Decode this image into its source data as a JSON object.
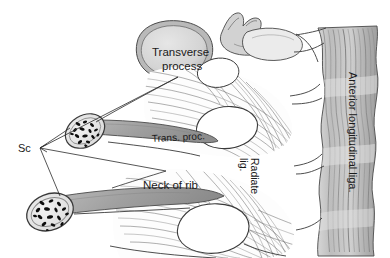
{
  "figure": {
    "background_color": "#ffffff",
    "line_color": "#3a3a3a",
    "labels": {
      "transverse_process": "Transverse\nprocess",
      "transverse_process_line1": "Transverse",
      "transverse_process_line2": "process",
      "trans_proc_short": "Trans. proc.",
      "neck_of_rib": "Neck of rib",
      "sc": "Sc",
      "radiate_lig_line1": "Radiate",
      "radiate_lig_line2": "lig.",
      "anterior_longitudinal": "Anterior longitudinal liga."
    },
    "structures": [
      {
        "name": "transverse-process-upper",
        "label": "Transverse process",
        "fill": "#d8d8d8",
        "rim": "#9a9a9a"
      },
      {
        "name": "rib-neck-upper",
        "label": "Trans. proc.",
        "fill": "#9a9a9a"
      },
      {
        "name": "rib-neck-lower",
        "label": "Neck of rib",
        "fill": "#9a9a9a"
      },
      {
        "name": "cut-rib-end-upper",
        "label": "Sc",
        "fill": "#e8e8e8",
        "trabeculae": "#111111"
      },
      {
        "name": "cut-rib-end-lower",
        "label": "Sc",
        "fill": "#e8e8e8",
        "trabeculae": "#111111"
      },
      {
        "name": "radiate-ligament-upper",
        "label": "Radiate lig.",
        "fill": "#ffffff"
      },
      {
        "name": "radiate-ligament-lower",
        "label": "Radiate lig.",
        "fill": "#ffffff"
      },
      {
        "name": "anterior-longitudinal-ligament",
        "label": "Anterior longitudinal liga.",
        "fill": "#c9c9c9"
      },
      {
        "name": "vertebral-body-upper",
        "label": "",
        "fill": "#ffffff"
      },
      {
        "name": "vertebral-body-lower",
        "label": "",
        "fill": "#ffffff"
      },
      {
        "name": "superior-articular-process",
        "label": "",
        "fill": "#dcdcdc"
      }
    ],
    "colors": {
      "bone_light": "#e4e4e4",
      "bone_mid": "#c9c9c9",
      "bone_dark": "#9a9a9a",
      "trabecular": "#111111",
      "ligament_band": "#c4c4c4",
      "outline": "#3a3a3a",
      "fiber": "#6e6e6e"
    }
  }
}
